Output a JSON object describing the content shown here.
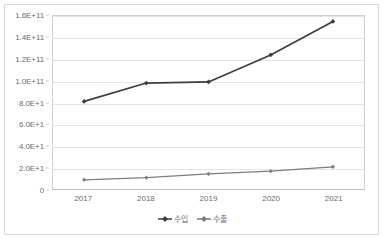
{
  "chart_data": {
    "type": "line",
    "title": "",
    "subtitle": "",
    "xlabel": "",
    "ylabel": "",
    "categories": [
      "2017",
      "2018",
      "2019",
      "2020",
      "2021"
    ],
    "series": [
      {
        "name": "수입",
        "color": "#3f3f3f",
        "marker": "diamond",
        "values": [
          81000000000,
          98000000000,
          99000000000,
          124000000000,
          155000000000
        ]
      },
      {
        "name": "수출",
        "color": "#7d7d7d",
        "marker": "diamond",
        "values": [
          8500000000,
          10500000000,
          14000000000,
          16500000000,
          20500000000
        ]
      }
    ],
    "ylim": [
      0,
      160000000000
    ],
    "y_ticks": [
      {
        "value": 160000000000,
        "label": "1.6E+11"
      },
      {
        "value": 140000000000,
        "label": "1.4E+11"
      },
      {
        "value": 120000000000,
        "label": "1.2E+11"
      },
      {
        "value": 100000000000,
        "label": "1.0E+11"
      },
      {
        "value": 80000000000,
        "label": "8.0E+1"
      },
      {
        "value": 60000000000,
        "label": "6.0E+1"
      },
      {
        "value": 40000000000,
        "label": "4.0E+1"
      },
      {
        "value": 20000000000,
        "label": "2.0E+1"
      },
      {
        "value": 0,
        "label": "0"
      }
    ],
    "grid": true,
    "legend_position": "bottom",
    "plot_background": "#ffffff",
    "gridline_color": "#e4e4e4",
    "axis_color": "#c9c9c9",
    "tick_label_color": "#6b6b6b",
    "border_color": "#d9d9d9"
  }
}
